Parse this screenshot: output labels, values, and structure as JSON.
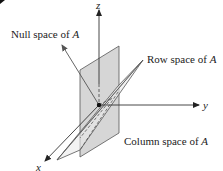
{
  "diagram": {
    "labels": {
      "null_space": "Null space of ",
      "row_space": "Row space of ",
      "column_space": "Column space of ",
      "matrix": "A"
    },
    "axes": {
      "x": "x",
      "y": "y",
      "z": "z"
    },
    "colors": {
      "column_plane_fill": "#d4d4d4",
      "row_plane_fill": "#e6e6e6",
      "stroke": "#444444",
      "axis": "#333333"
    }
  }
}
